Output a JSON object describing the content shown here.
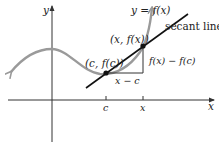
{
  "diagram": {
    "type": "secant-line-illustration",
    "colors": {
      "axis": "#333333",
      "curve": "#9a9a9a",
      "secant": "#111111",
      "triangle": "#333333",
      "point": "#111111",
      "text": "#222222"
    },
    "labels": {
      "y_axis": "y",
      "x_axis": "x",
      "function": "y = f(x)",
      "secant": "secant line",
      "point_c": "(c, f(c))",
      "point_x": "(x, f(x))",
      "rise": "f(x) − f(c)",
      "run": "x − c",
      "tick_c": "c",
      "tick_x": "x"
    },
    "points": [
      {
        "name": "c",
        "coords": "(c, f(c))"
      },
      {
        "name": "x",
        "coords": "(x, f(x))"
      }
    ]
  }
}
